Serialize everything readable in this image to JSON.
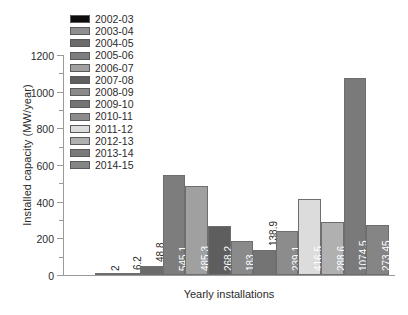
{
  "chart_data": {
    "type": "bar",
    "title": "",
    "xlabel": "Yearly installations",
    "ylabel": "Installed capacity (MW/year)",
    "categories": [
      "2002-03",
      "2003-04",
      "2004-05",
      "2005-06",
      "2006-07",
      "2007-08",
      "2008-09",
      "2009-10",
      "2010-11",
      "2011-12",
      "2012-13",
      "2013-14",
      "2014-15"
    ],
    "values": [
      2,
      6.2,
      48.8,
      545.1,
      485.3,
      268.2,
      183,
      138.9,
      239.1,
      416.5,
      288.6,
      1074.5,
      273.45
    ],
    "value_labels": [
      "2",
      "6.2",
      "48.8",
      "545.1",
      "485.3",
      "268.2",
      "183",
      "138.9",
      "239.1",
      "416.5",
      "288.6",
      "1074.5",
      "273.45"
    ],
    "colors": [
      "#0d0d0d",
      "#8f8f8f",
      "#6b6b6b",
      "#7d7d7d",
      "#a0a0a0",
      "#5e5e5e",
      "#8a8a8a",
      "#747474",
      "#8c8c8c",
      "#dcdcdc",
      "#b0b0b0",
      "#7a7a7a",
      "#858585"
    ],
    "ylim": [
      0,
      1200
    ],
    "ytick_labels": [
      "0",
      "200",
      "400",
      "600",
      "800",
      "1000",
      "1200"
    ],
    "ytick_values": [
      0,
      200,
      400,
      600,
      800,
      1000,
      1200
    ],
    "yminor_values": [
      100,
      300,
      500,
      700,
      900,
      1100
    ],
    "grid": false,
    "legend_position": "upper-left",
    "legend_entries": [
      "2002-03",
      "2003-04",
      "2004-05",
      "2005-06",
      "2006-07",
      "2007-08",
      "2008-09",
      "2009-10",
      "2010-11",
      "2011-12",
      "2012-13",
      "2013-14",
      "2014-15"
    ]
  },
  "axes": {
    "axis_color": "#9a9a9a"
  }
}
